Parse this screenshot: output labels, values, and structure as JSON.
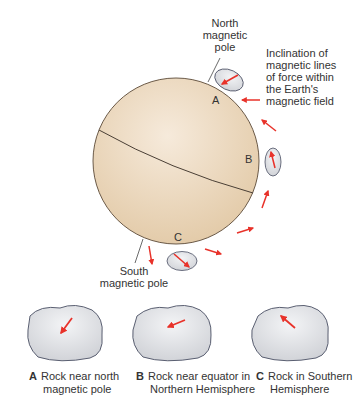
{
  "figure": {
    "north_pole_label": [
      "North",
      "magnetic",
      "pole"
    ],
    "south_pole_label": [
      "South",
      "magnetic pole"
    ],
    "inclination_label": [
      "Inclination of",
      "magnetic lines",
      "of force within",
      "the Earth's",
      "magnetic field"
    ],
    "globe_markers": {
      "a": "A",
      "b": "B",
      "c": "C"
    },
    "colors": {
      "globe": "#ecd9bd",
      "globe_edge": "#6b5a48",
      "arrow": "#e8322a",
      "rock": "#e4e5e8",
      "rock_edge": "#4a4f63"
    }
  },
  "captions": [
    {
      "letter": "A",
      "line1": "Rock near north",
      "line2": "magnetic pole"
    },
    {
      "letter": "B",
      "line1": "Rock near equator in",
      "line2": "Northern Hemisphere"
    },
    {
      "letter": "C",
      "line1": "Rock in Southern",
      "line2": "Hemisphere"
    }
  ]
}
